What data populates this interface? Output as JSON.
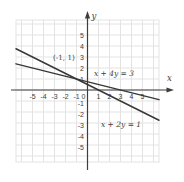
{
  "figure": {
    "background": "#ffffff",
    "grid_color": "#e3e3e3",
    "axis_color": "#3d3d3d",
    "line_color": "#383838",
    "text_color": "#3d3d3d"
  },
  "chart_data": {
    "type": "line",
    "title": "",
    "xlabel": "x",
    "ylabel": "y",
    "x_range": [
      -6.5,
      6.5
    ],
    "y_range": [
      -6.5,
      6.4
    ],
    "grid": true,
    "x_ticks": [
      -5,
      -4,
      -3,
      -2,
      -1,
      0,
      1,
      2,
      3,
      4,
      5
    ],
    "y_ticks": [
      5,
      4,
      3,
      2,
      1,
      -1,
      -2,
      -3,
      -4,
      -5
    ],
    "series": [
      {
        "name": "x + 4y = 3",
        "equation": {
          "a": 1,
          "b": 4,
          "c": 3
        },
        "slope": -0.25,
        "y_intercept": 0.75,
        "x_intercept": 3,
        "sample_points": [
          [
            -1,
            1
          ],
          [
            3,
            0
          ]
        ],
        "label": {
          "text": "x + 4y = 3",
          "x": 2.41,
          "y": 1.5
        }
      },
      {
        "name": "x + 2y = 1",
        "equation": {
          "a": 1,
          "b": 2,
          "c": 1
        },
        "slope": -0.5,
        "y_intercept": 0.5,
        "x_intercept": 1,
        "sample_points": [
          [
            -1,
            1
          ],
          [
            1,
            0
          ]
        ],
        "label": {
          "text": "x + 2y = 1",
          "x": 3.05,
          "y": -3.14
        }
      }
    ],
    "intersection": {
      "x": -1,
      "y": 1,
      "label": {
        "text": "(-1, 1)",
        "x": -2.14,
        "y": 2.95
      }
    }
  }
}
